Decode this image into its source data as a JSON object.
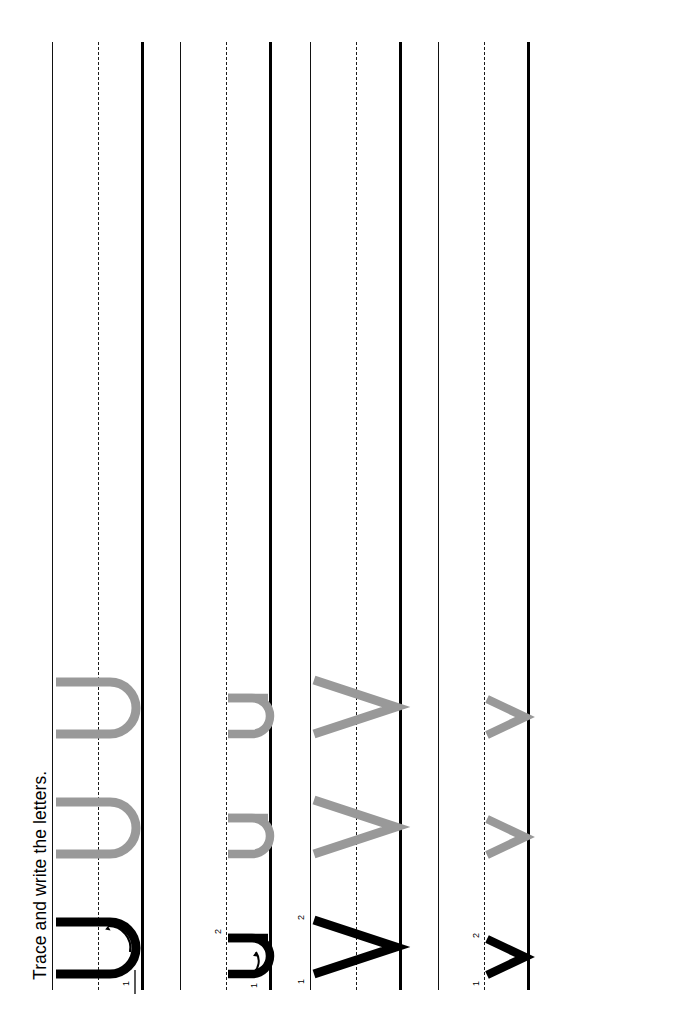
{
  "worksheet": {
    "title": "Trace and write the letters.",
    "orientation": "landscape-rotated",
    "paper": {
      "width": 694,
      "height": 1032,
      "background": "#ffffff"
    },
    "colors": {
      "trace_gray": "#999999",
      "model_black": "#000000",
      "rule_line": "#111111",
      "baseline": "#000000",
      "midline_dashed": "#1a1a1a"
    },
    "rows": [
      {
        "index": 1,
        "letter": "U",
        "case": "uppercase",
        "height_zone": "full",
        "stroke_count": 1,
        "stroke_numbers": [
          "1"
        ],
        "items": [
          {
            "kind": "model",
            "color": "#000000",
            "has_arrows": true,
            "arrow_count": 1
          },
          {
            "kind": "trace",
            "color": "#999999",
            "has_arrows": false,
            "arrow_count": 0
          },
          {
            "kind": "trace",
            "color": "#999999",
            "has_arrows": false,
            "arrow_count": 0
          }
        ]
      },
      {
        "index": 2,
        "letter": "u",
        "case": "lowercase",
        "height_zone": "x-height",
        "stroke_count": 2,
        "stroke_numbers": [
          "1",
          "2"
        ],
        "items": [
          {
            "kind": "model",
            "color": "#000000",
            "has_arrows": true,
            "arrow_count": 2
          },
          {
            "kind": "trace",
            "color": "#999999",
            "has_arrows": false,
            "arrow_count": 0
          },
          {
            "kind": "trace",
            "color": "#999999",
            "has_arrows": false,
            "arrow_count": 0
          }
        ]
      },
      {
        "index": 3,
        "letter": "V",
        "case": "uppercase",
        "height_zone": "full",
        "stroke_count": 2,
        "stroke_numbers": [
          "1",
          "2"
        ],
        "items": [
          {
            "kind": "model",
            "color": "#000000",
            "has_arrows": true,
            "arrow_count": 2
          },
          {
            "kind": "trace",
            "color": "#999999",
            "has_arrows": false,
            "arrow_count": 0
          },
          {
            "kind": "trace",
            "color": "#999999",
            "has_arrows": false,
            "arrow_count": 0
          }
        ]
      },
      {
        "index": 4,
        "letter": "v",
        "case": "lowercase",
        "height_zone": "x-height",
        "stroke_count": 2,
        "stroke_numbers": [
          "1",
          "2"
        ],
        "items": [
          {
            "kind": "model",
            "color": "#000000",
            "has_arrows": true,
            "arrow_count": 2
          },
          {
            "kind": "trace",
            "color": "#999999",
            "has_arrows": false,
            "arrow_count": 0
          },
          {
            "kind": "trace",
            "color": "#999999",
            "has_arrows": false,
            "arrow_count": 0
          }
        ]
      }
    ]
  }
}
